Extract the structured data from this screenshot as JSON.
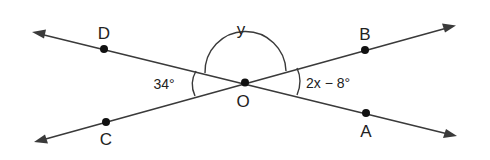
{
  "figure": {
    "type": "intersecting-lines-angle-diagram",
    "intersection_point": "O",
    "lines": [
      {
        "name": "line-DA",
        "through": [
          "D",
          "O",
          "A"
        ]
      },
      {
        "name": "line-CB",
        "through": [
          "C",
          "O",
          "B"
        ]
      }
    ],
    "points": {
      "D": "D",
      "B": "B",
      "C": "C",
      "A": "A",
      "O": "O"
    },
    "angles": {
      "left": {
        "between": [
          "D",
          "O",
          "C"
        ],
        "label": "34°"
      },
      "top": {
        "between": [
          "D",
          "O",
          "B"
        ],
        "label": "y"
      },
      "right": {
        "between": [
          "B",
          "O",
          "A"
        ],
        "label": "2x − 8°"
      }
    },
    "colors": {
      "line": "#3a3a3a",
      "point": "#111111",
      "text": "#222222",
      "background": "#ffffff"
    }
  }
}
